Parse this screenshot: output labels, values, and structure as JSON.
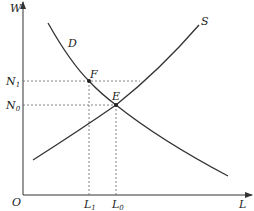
{
  "diagram": {
    "type": "supply-demand",
    "axes": {
      "y_label": "W",
      "x_label": "L",
      "origin_label": "O"
    },
    "curves": [
      {
        "name": "D",
        "label": "D",
        "kind": "demand"
      },
      {
        "name": "S",
        "label": "S",
        "kind": "supply"
      }
    ],
    "points": [
      {
        "name": "F",
        "label": "F"
      },
      {
        "name": "E",
        "label": "E"
      }
    ],
    "y_ticks": [
      {
        "base": "N",
        "sub": "1"
      },
      {
        "base": "N",
        "sub": "0"
      }
    ],
    "x_ticks": [
      {
        "base": "L",
        "sub": "1"
      },
      {
        "base": "L",
        "sub": "0"
      }
    ],
    "colors": {
      "line": "#333333",
      "dashed": "#666666",
      "text": "#222222"
    }
  }
}
